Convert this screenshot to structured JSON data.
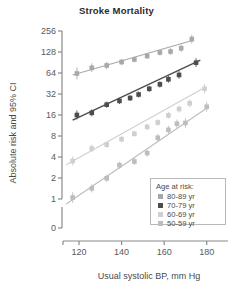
{
  "figure": {
    "title": "Stroke Mortality"
  },
  "legend": {
    "title": "Age at risk:",
    "position": "inside-bottom-right",
    "entries": [
      {
        "label": "80-89 yr",
        "color": "#a8a8a8"
      },
      {
        "label": "70-79 yr",
        "color": "#4d4d4d"
      },
      {
        "label": "60-69 yr",
        "color": "#cfcfcf"
      },
      {
        "label": "50-59 yr",
        "color": "#bdbdbd"
      }
    ]
  },
  "chart_data": {
    "type": "scatter",
    "title": "Stroke Mortality",
    "subtitle": "",
    "xlabel": "Usual systolic BP, mm Hg",
    "ylabel": "Absolute risk and 95% CI",
    "xlim": [
      112,
      190
    ],
    "ylim": [
      1,
      256
    ],
    "yscale": "log2",
    "grid": false,
    "xticks": [
      120,
      140,
      160,
      180
    ],
    "yticks": [
      0,
      1,
      2,
      4,
      8,
      16,
      32,
      64,
      128,
      256
    ],
    "ytick_labels": [
      "0",
      "1",
      "2",
      "4",
      "8",
      "16",
      "32",
      "64",
      "128",
      "256"
    ],
    "axis_break_below": 1,
    "error_bars": "95% CI (vertical)",
    "series": [
      {
        "name": "80-89 yr",
        "color": "#a8a8a8",
        "marker": "square",
        "fit_line": {
          "x": [
            117,
            174
          ],
          "y": [
            60,
            190
          ]
        },
        "points": [
          {
            "x": 119,
            "y": 63,
            "ci_low": 52,
            "ci_high": 77
          },
          {
            "x": 126,
            "y": 76,
            "ci_low": 66,
            "ci_high": 88
          },
          {
            "x": 133,
            "y": 82,
            "ci_low": 73,
            "ci_high": 92
          },
          {
            "x": 140,
            "y": 92,
            "ci_low": 83,
            "ci_high": 102
          },
          {
            "x": 146,
            "y": 100,
            "ci_low": 91,
            "ci_high": 110
          },
          {
            "x": 152,
            "y": 112,
            "ci_low": 102,
            "ci_high": 123
          },
          {
            "x": 158,
            "y": 126,
            "ci_low": 114,
            "ci_high": 139
          },
          {
            "x": 163,
            "y": 130,
            "ci_low": 117,
            "ci_high": 145
          },
          {
            "x": 168,
            "y": 145,
            "ci_low": 129,
            "ci_high": 163
          },
          {
            "x": 173,
            "y": 196,
            "ci_low": 170,
            "ci_high": 226
          }
        ]
      },
      {
        "name": "70-79 yr",
        "color": "#4d4d4d",
        "marker": "square",
        "fit_line": {
          "x": [
            117,
            177
          ],
          "y": [
            13.5,
            98
          ]
        },
        "points": [
          {
            "x": 119,
            "y": 16.0,
            "ci_low": 13.8,
            "ci_high": 18.6
          },
          {
            "x": 126,
            "y": 17.2,
            "ci_low": 15.3,
            "ci_high": 19.3
          },
          {
            "x": 133,
            "y": 22.5,
            "ci_low": 20.3,
            "ci_high": 24.9
          },
          {
            "x": 139,
            "y": 25.5,
            "ci_low": 23.0,
            "ci_high": 28.3
          },
          {
            "x": 144,
            "y": 28.0,
            "ci_low": 25.4,
            "ci_high": 30.9
          },
          {
            "x": 148,
            "y": 31.5,
            "ci_low": 28.5,
            "ci_high": 34.8
          },
          {
            "x": 153,
            "y": 38.0,
            "ci_low": 34.4,
            "ci_high": 42.0
          },
          {
            "x": 158,
            "y": 44.0,
            "ci_low": 39.6,
            "ci_high": 48.9
          },
          {
            "x": 162,
            "y": 52.0,
            "ci_low": 46.6,
            "ci_high": 58.0
          },
          {
            "x": 167,
            "y": 60.0,
            "ci_low": 53.0,
            "ci_high": 68.0
          },
          {
            "x": 175,
            "y": 90.0,
            "ci_low": 78.0,
            "ci_high": 104.0
          }
        ]
      },
      {
        "name": "60-69 yr",
        "color": "#cfcfcf",
        "marker": "square",
        "fit_line": {
          "x": [
            114,
            178
          ],
          "y": [
            3.1,
            38
          ]
        },
        "points": [
          {
            "x": 117,
            "y": 3.5,
            "ci_low": 3.0,
            "ci_high": 4.1
          },
          {
            "x": 126,
            "y": 5.3,
            "ci_low": 4.7,
            "ci_high": 6.0
          },
          {
            "x": 133,
            "y": 6.0,
            "ci_low": 5.4,
            "ci_high": 6.7
          },
          {
            "x": 140,
            "y": 7.2,
            "ci_low": 6.5,
            "ci_high": 8.0
          },
          {
            "x": 146,
            "y": 8.6,
            "ci_low": 7.8,
            "ci_high": 9.5
          },
          {
            "x": 152,
            "y": 10.8,
            "ci_low": 9.7,
            "ci_high": 12.0
          },
          {
            "x": 157,
            "y": 12.5,
            "ci_low": 11.2,
            "ci_high": 13.9
          },
          {
            "x": 162,
            "y": 15.8,
            "ci_low": 14.1,
            "ci_high": 17.7
          },
          {
            "x": 167,
            "y": 19.5,
            "ci_low": 17.3,
            "ci_high": 22.0
          },
          {
            "x": 172,
            "y": 23.5,
            "ci_low": 20.6,
            "ci_high": 26.8
          },
          {
            "x": 179,
            "y": 38.0,
            "ci_low": 32.5,
            "ci_high": 44.5
          }
        ]
      },
      {
        "name": "50-59 yr",
        "color": "#bdbdbd",
        "marker": "square",
        "fit_line": {
          "x": [
            114,
            181
          ],
          "y": [
            0.85,
            21
          ]
        },
        "points": [
          {
            "x": 117,
            "y": 1.05,
            "ci_low": 0.88,
            "ci_high": 1.25
          },
          {
            "x": 126,
            "y": 1.42,
            "ci_low": 1.24,
            "ci_high": 1.63
          },
          {
            "x": 133,
            "y": 1.98,
            "ci_low": 1.76,
            "ci_high": 2.23
          },
          {
            "x": 139,
            "y": 3.05,
            "ci_low": 2.72,
            "ci_high": 3.42
          },
          {
            "x": 146,
            "y": 3.45,
            "ci_low": 3.08,
            "ci_high": 3.86
          },
          {
            "x": 152,
            "y": 4.55,
            "ci_low": 4.05,
            "ci_high": 5.11
          },
          {
            "x": 157,
            "y": 7.55,
            "ci_low": 6.7,
            "ci_high": 8.5
          },
          {
            "x": 162,
            "y": 9.8,
            "ci_low": 8.6,
            "ci_high": 11.2
          },
          {
            "x": 166,
            "y": 12.0,
            "ci_low": 10.4,
            "ci_high": 13.8
          },
          {
            "x": 170,
            "y": 12.3,
            "ci_low": 10.5,
            "ci_high": 14.4
          },
          {
            "x": 180,
            "y": 21.0,
            "ci_low": 17.8,
            "ci_high": 24.8
          }
        ]
      }
    ]
  }
}
